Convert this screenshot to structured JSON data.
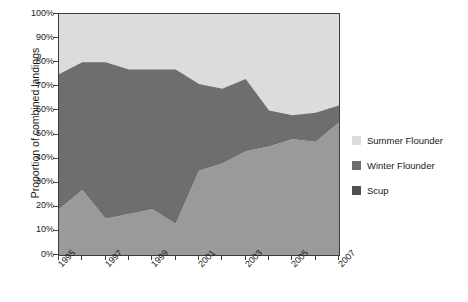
{
  "chart_data": {
    "type": "area",
    "stacked": true,
    "percent_stacked": true,
    "title": "",
    "xlabel": "",
    "ylabel": "Proportion of combined landings",
    "ylim": [
      0,
      100
    ],
    "ytick_labels": [
      "100%",
      "90%",
      "80%",
      "70%",
      "60%",
      "50%",
      "40%",
      "30%",
      "20%",
      "10%",
      "0%"
    ],
    "ytick_values": [
      100,
      90,
      80,
      70,
      60,
      50,
      40,
      30,
      20,
      10,
      0
    ],
    "grid": false,
    "legend_position": "right",
    "x": [
      1995,
      1996,
      1997,
      1998,
      1999,
      2000,
      2001,
      2002,
      2003,
      2004,
      2005,
      2006,
      2007
    ],
    "xtick_labels": [
      "1995",
      "",
      "1997",
      "",
      "1999",
      "",
      "2001",
      "",
      "2003",
      "",
      "2005",
      "",
      "2007"
    ],
    "xtick_labels_shown": [
      "1995",
      "1997",
      "1999",
      "2001",
      "2003",
      "2005",
      "2007"
    ],
    "series": [
      {
        "name": "Scup",
        "color": "#9a9a9a",
        "values": [
          19,
          27,
          15,
          17,
          19,
          13,
          35,
          38,
          43,
          45,
          48,
          47,
          55
        ]
      },
      {
        "name": "Winter Flounder",
        "color": "#6e6e6e",
        "values": [
          56,
          53,
          65,
          60,
          58,
          64,
          36,
          31,
          30,
          15,
          10,
          12,
          7
        ]
      },
      {
        "name": "Summer Flounder",
        "color": "#dcdcdc",
        "values": [
          25,
          20,
          20,
          23,
          23,
          23,
          29,
          31,
          27,
          40,
          42,
          41,
          38
        ]
      }
    ],
    "cumulative_upper_bounds": {
      "scup_top": [
        19,
        27,
        15,
        17,
        19,
        13,
        35,
        38,
        43,
        45,
        48,
        47,
        55
      ],
      "winter_flounder_top": [
        75,
        80,
        80,
        77,
        77,
        77,
        71,
        69,
        73,
        60,
        58,
        59,
        62
      ],
      "summer_flounder_top": [
        100,
        100,
        100,
        100,
        100,
        100,
        100,
        100,
        100,
        100,
        100,
        100,
        100
      ]
    }
  },
  "legend": {
    "items": [
      {
        "label": "Summer Flounder",
        "color": "#dcdcdc"
      },
      {
        "label": "Winter Flounder",
        "color": "#6e6e6e"
      },
      {
        "label": "Scup",
        "color": "#505050"
      }
    ]
  },
  "axes": {
    "y_title": "Proportion of combined landings"
  }
}
